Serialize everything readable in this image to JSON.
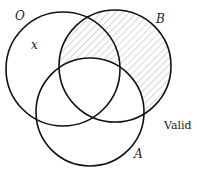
{
  "diagram": {
    "type": "venn",
    "sets": [
      {
        "id": "O",
        "label": "O",
        "cx": 63,
        "cy": 69,
        "r": 57
      },
      {
        "id": "B",
        "label": "B",
        "cx": 115,
        "cy": 66,
        "r": 56
      },
      {
        "id": "A",
        "label": "A",
        "cx": 90,
        "cy": 112,
        "r": 54
      }
    ],
    "shaded_region": "B minus A",
    "point_label": "x",
    "verdict": "Valid",
    "colors": {
      "stroke": "#111111",
      "hatch": "#9a9a9a",
      "background": "#ffffff"
    }
  }
}
